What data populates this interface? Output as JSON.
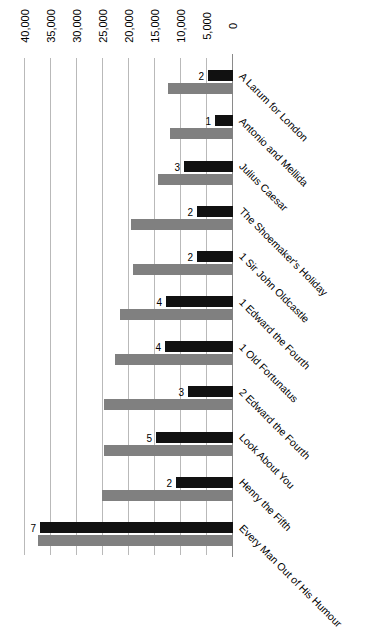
{
  "chart_data": {
    "type": "bar",
    "title": "",
    "subtitle": "",
    "xlabel": "",
    "ylabel": "",
    "orientation": "horizontal",
    "grid": true,
    "legend_position": "none",
    "axis_min": 0,
    "axis_max": 40000,
    "axis_ticks": [
      "0",
      "5,000",
      "10,000",
      "15,000",
      "20,000",
      "25,000",
      "30,000",
      "35,000",
      "40,000"
    ],
    "axis_tick_values": [
      0,
      5000,
      10000,
      15000,
      20000,
      25000,
      30000,
      35000,
      40000
    ],
    "categories": [
      "Every Man Out of His Humour",
      "Henry the Fifth",
      "Look About You",
      "2 Edward the Fourth",
      "1 Old Fortunatus",
      "1 Edward the Fourth",
      "1 Sir John Oldcastle",
      "The Shoemaker's Holiday",
      "Julius Caesar",
      "Antonio and Mellida",
      "A Larum for London"
    ],
    "series": [
      {
        "name": "Total",
        "color": "#808080",
        "values": [
          37500,
          25200,
          24800,
          24800,
          22600,
          21800,
          19200,
          19600,
          14400,
          12200,
          12500
        ]
      },
      {
        "name": "Edition count",
        "color": "#111111",
        "values": [
          7,
          2,
          5,
          3,
          4,
          4,
          2,
          2,
          3,
          1,
          2
        ]
      }
    ],
    "data_labels": [
      "7",
      "2",
      "5",
      "3",
      "4",
      "4",
      "2",
      "2",
      "3",
      "1",
      "2"
    ],
    "black_bar_lengths": [
      37200,
      11000,
      14800,
      8700,
      13000,
      12900,
      6900,
      6900,
      9400,
      3500,
      4800
    ]
  }
}
